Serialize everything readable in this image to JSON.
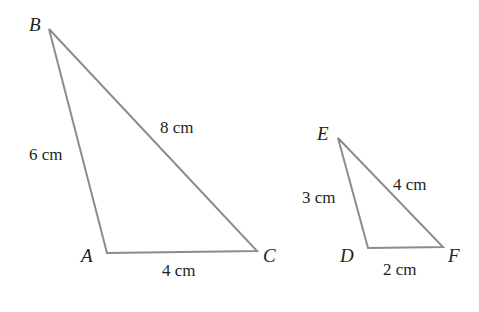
{
  "diagram": {
    "type": "similar-triangles",
    "line_color": "#8c8c8c",
    "text_color": "#231f20",
    "triangles": [
      {
        "name": "ABC",
        "vertices": {
          "A": {
            "label": "A",
            "x": 107,
            "y": 253
          },
          "B": {
            "label": "B",
            "x": 49,
            "y": 29
          },
          "C": {
            "label": "C",
            "x": 257,
            "y": 251
          }
        },
        "sides": {
          "AB": "6 cm",
          "BC": "8 cm",
          "AC": "4 cm"
        }
      },
      {
        "name": "DEF",
        "vertices": {
          "D": {
            "label": "D",
            "x": 368,
            "y": 248
          },
          "E": {
            "label": "E",
            "x": 338,
            "y": 138
          },
          "F": {
            "label": "F",
            "x": 443,
            "y": 247
          }
        },
        "sides": {
          "DE": "3 cm",
          "EF": "4 cm",
          "DF": "2 cm"
        }
      }
    ]
  }
}
